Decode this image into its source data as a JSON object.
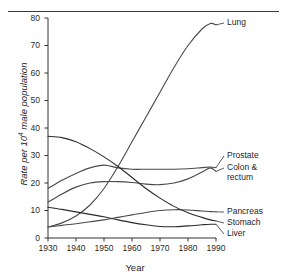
{
  "figure": {
    "ylabel_prefix": "Rate per 10",
    "ylabel_exponent": "4",
    "ylabel_suffix": " male population",
    "xlabel": "Year"
  },
  "axes": {
    "y_ticks": [
      "0",
      "10",
      "20",
      "30",
      "40",
      "50",
      "60",
      "70",
      "80"
    ],
    "x_ticks": [
      "1930",
      "1940",
      "1950",
      "1960",
      "1970",
      "1980",
      "1990"
    ]
  },
  "series_labels": {
    "lung": "Lung",
    "prostate": "Prostate",
    "colon_line1": "Colon &",
    "colon_line2": "rectum",
    "pancreas": "Pancreas",
    "stomach": "Stomach",
    "liver": "Liver"
  },
  "chart_data": {
    "type": "line",
    "title": "",
    "xlabel": "Year",
    "ylabel": "Rate per 10^4 male population",
    "xlim": [
      1930,
      1990
    ],
    "ylim": [
      0,
      80
    ],
    "xticks": [
      1930,
      1940,
      1950,
      1960,
      1970,
      1980,
      1990
    ],
    "yticks": [
      0,
      10,
      20,
      30,
      40,
      50,
      60,
      70,
      80
    ],
    "grid": false,
    "legend_position": "right-inline-labels",
    "x": [
      1930,
      1935,
      1940,
      1945,
      1950,
      1955,
      1960,
      1965,
      1970,
      1975,
      1980,
      1985,
      1988,
      1990
    ],
    "series": [
      {
        "name": "Lung",
        "color": "#4a4a4a",
        "values": [
          4,
          5.5,
          8,
          12,
          18,
          26,
          35,
          44,
          53,
          62,
          70,
          76,
          78,
          77.5
        ]
      },
      {
        "name": "Prostate",
        "color": "#4a4a4a",
        "values": [
          18,
          21,
          23.5,
          25.5,
          26.5,
          25.5,
          25,
          25,
          25,
          25,
          25.2,
          25.6,
          25.8,
          25.6
        ]
      },
      {
        "name": "Colon & rectum",
        "color": "#4a4a4a",
        "values": [
          13,
          16,
          18.5,
          20,
          20.5,
          20.5,
          20.2,
          19.6,
          19.4,
          20,
          21.5,
          24,
          25.5,
          24.2
        ]
      },
      {
        "name": "Pancreas",
        "color": "#4a4a4a",
        "values": [
          4,
          4.6,
          5.2,
          5.9,
          6.6,
          7.5,
          8.4,
          9.3,
          10,
          10.3,
          10.2,
          9.8,
          9.6,
          9.5
        ]
      },
      {
        "name": "Stomach",
        "color": "#2a2a2a",
        "values": [
          37,
          36.5,
          35,
          32.5,
          29.5,
          26,
          22,
          18,
          14.5,
          11.5,
          9.2,
          7.5,
          6.6,
          6.2
        ]
      },
      {
        "name": "Liver",
        "color": "#2a2a2a",
        "values": [
          11.2,
          10.4,
          9.5,
          8.6,
          7.7,
          6.6,
          5.6,
          4.8,
          4.2,
          4.1,
          4.4,
          4.8,
          5,
          5
        ]
      }
    ],
    "annotations": [
      {
        "text": "Lung",
        "x": 1990,
        "y": 77.5
      },
      {
        "text": "Prostate",
        "x": 1990,
        "y": 25.6
      },
      {
        "text": "Colon & rectum",
        "x": 1990,
        "y": 24.2
      },
      {
        "text": "Pancreas",
        "x": 1990,
        "y": 9.5
      },
      {
        "text": "Stomach",
        "x": 1990,
        "y": 6.2
      },
      {
        "text": "Liver",
        "x": 1990,
        "y": 5.0
      }
    ]
  }
}
